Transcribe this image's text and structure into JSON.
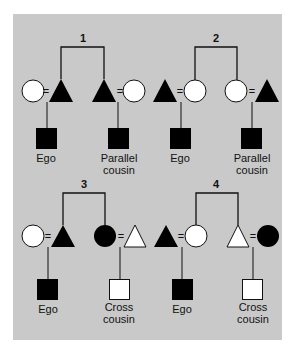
{
  "colors": {
    "panel": "#c9c9c9",
    "filled": "#000000",
    "empty": "#ffffff",
    "line": "#111111"
  },
  "diagrams": [
    {
      "number": "1",
      "left_couple": [
        "female-empty",
        "male-filled"
      ],
      "right_couple": [
        "male-filled",
        "female-empty"
      ],
      "ego_label": "Ego",
      "cousin_label_line1": "Parallel",
      "cousin_label_line2": "cousin",
      "cousin_symbol": "male-filled"
    },
    {
      "number": "2",
      "left_couple": [
        "male-filled",
        "female-empty"
      ],
      "right_couple": [
        "female-empty",
        "male-filled"
      ],
      "ego_label": "Ego",
      "cousin_label_line1": "Parallel",
      "cousin_label_line2": "cousin",
      "cousin_symbol": "male-filled"
    },
    {
      "number": "3",
      "left_couple": [
        "female-empty",
        "male-filled"
      ],
      "right_couple": [
        "female-filled",
        "male-empty"
      ],
      "ego_label": "Ego",
      "cousin_label_line1": "Cross",
      "cousin_label_line2": "cousin",
      "cousin_symbol": "male-empty"
    },
    {
      "number": "4",
      "left_couple": [
        "male-filled",
        "female-empty"
      ],
      "right_couple": [
        "male-empty",
        "female-filled"
      ],
      "ego_label": "Ego",
      "cousin_label_line1": "Cross",
      "cousin_label_line2": "cousin",
      "cousin_symbol": "male-empty"
    }
  ],
  "marriage_symbol": "="
}
